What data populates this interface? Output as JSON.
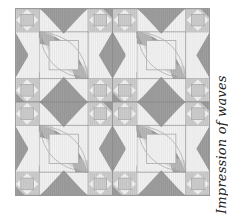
{
  "figure": {
    "caption": "Impression of waves",
    "grid": {
      "cols": 2,
      "rows": 2
    },
    "colors": {
      "light": "#f1f1f1",
      "mid": "#cfcfcf",
      "dark": "#9a9a9a",
      "line": "#8a8a8a",
      "arc": "#b5b5b5"
    }
  }
}
